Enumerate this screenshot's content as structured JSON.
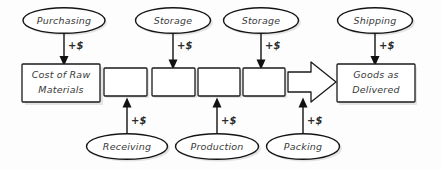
{
  "diagram": {
    "background_color": "#fdfdfd",
    "stroke_color": "#141414",
    "text_color": "#3a3a3a",
    "cost_label": "+$",
    "top_nodes": [
      {
        "label": "Purchasing",
        "cost": "+$"
      },
      {
        "label": "Storage",
        "cost": "+$"
      },
      {
        "label": "Storage",
        "cost": "+$"
      },
      {
        "label": "Shipping",
        "cost": "+$"
      }
    ],
    "bottom_nodes": [
      {
        "label": "Receiving",
        "cost": "+$"
      },
      {
        "label": "Production",
        "cost": "+$"
      },
      {
        "label": "Packing",
        "cost": "+$"
      }
    ],
    "start_box": {
      "line1": "Cost of Raw",
      "line2": "Materials"
    },
    "end_box": {
      "line1": "Goods as",
      "line2": "Delivered"
    },
    "process_boxes": [
      {
        "label": ""
      },
      {
        "label": ""
      },
      {
        "label": ""
      },
      {
        "label": ""
      }
    ],
    "flow_arrow": {
      "name": "block-arrow",
      "direction": "right"
    }
  }
}
